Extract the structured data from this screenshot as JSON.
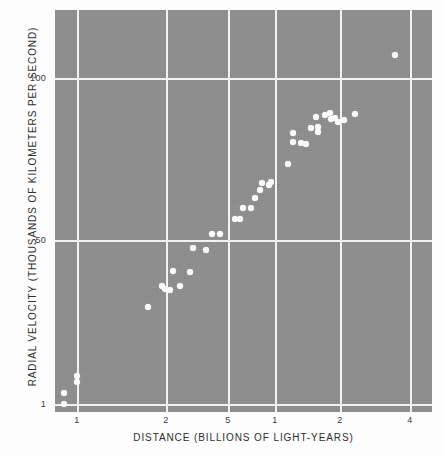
{
  "figure": {
    "background_color": "#8e8e8e",
    "page_color": "#fdfdfd",
    "grid_color": "#f2f2f2",
    "point_color": "#fbfbfb"
  },
  "chart_data": {
    "type": "scatter",
    "title": "",
    "xlabel": "DISTANCE (BILLIONS OF LIGHT-YEARS)",
    "ylabel": "RADIAL VELOCITY (THOUSANDS OF KILOMETERS PER SECOND)",
    "xscale": "log",
    "yscale": "log",
    "grid": true,
    "legend": null,
    "xticks": [
      {
        "label": "1",
        "px": 77
      },
      {
        "label": "2",
        "px": 166
      },
      {
        "label": "5",
        "px": 228
      },
      {
        "label": "1",
        "px": 275
      },
      {
        "label": "2",
        "px": 340
      },
      {
        "label": "4",
        "px": 410
      }
    ],
    "yticks": [
      {
        "label": "100",
        "px": 78
      },
      {
        "label": "50",
        "px": 240
      },
      {
        "label": "1",
        "px": 404
      }
    ],
    "points": [
      {
        "x": 64,
        "y": 404
      },
      {
        "x": 64,
        "y": 393
      },
      {
        "x": 77,
        "y": 376
      },
      {
        "x": 77,
        "y": 382
      },
      {
        "x": 148,
        "y": 307
      },
      {
        "x": 162,
        "y": 286
      },
      {
        "x": 165,
        "y": 289
      },
      {
        "x": 170,
        "y": 290
      },
      {
        "x": 180,
        "y": 286
      },
      {
        "x": 173,
        "y": 271
      },
      {
        "x": 190,
        "y": 272
      },
      {
        "x": 193,
        "y": 248
      },
      {
        "x": 206,
        "y": 250
      },
      {
        "x": 212,
        "y": 234
      },
      {
        "x": 220,
        "y": 234
      },
      {
        "x": 235,
        "y": 219
      },
      {
        "x": 240,
        "y": 219
      },
      {
        "x": 243,
        "y": 208
      },
      {
        "x": 251,
        "y": 208
      },
      {
        "x": 255,
        "y": 198
      },
      {
        "x": 260,
        "y": 190
      },
      {
        "x": 269,
        "y": 185
      },
      {
        "x": 271,
        "y": 182
      },
      {
        "x": 262,
        "y": 183
      },
      {
        "x": 288,
        "y": 164
      },
      {
        "x": 293,
        "y": 142
      },
      {
        "x": 301,
        "y": 143
      },
      {
        "x": 306,
        "y": 144
      },
      {
        "x": 293,
        "y": 133
      },
      {
        "x": 311,
        "y": 128
      },
      {
        "x": 318,
        "y": 127
      },
      {
        "x": 318,
        "y": 132
      },
      {
        "x": 325,
        "y": 115
      },
      {
        "x": 330,
        "y": 113
      },
      {
        "x": 331,
        "y": 119
      },
      {
        "x": 335,
        "y": 118
      },
      {
        "x": 338,
        "y": 122
      },
      {
        "x": 316,
        "y": 117
      },
      {
        "x": 344,
        "y": 120
      },
      {
        "x": 355,
        "y": 114
      },
      {
        "x": 395,
        "y": 55
      }
    ]
  }
}
